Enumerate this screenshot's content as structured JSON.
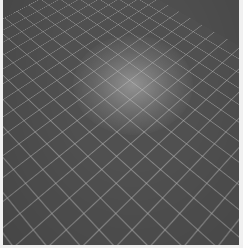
{
  "image": {
    "description": "Rendered grey floor with light diagonal grid lines in perspective, lit by a soft spotlight near the upper center",
    "colors": {
      "floor": "#505050",
      "grid_lines": "#b4b4b4",
      "spotlight": "#c8c8c8",
      "border": "#f0f0f0"
    }
  }
}
